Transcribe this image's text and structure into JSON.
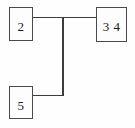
{
  "diagram": {
    "type": "node-link-graph",
    "width": 135,
    "height": 128,
    "background_color": "#fefefe",
    "line_color": "#3c3c3c",
    "border_color": "#4a4a4a",
    "text_color": "#1c1c1c",
    "nodes": [
      {
        "id": "node-2",
        "label": "2",
        "x": 9,
        "y": 7,
        "width": 24,
        "height": 34,
        "position": "top-left"
      },
      {
        "id": "node-34",
        "label": "3 4",
        "x": 96,
        "y": 7,
        "width": 31,
        "height": 35,
        "position": "top-right"
      },
      {
        "id": "node-5",
        "label": "5",
        "x": 9,
        "y": 86,
        "width": 24,
        "height": 33,
        "position": "bottom-left"
      }
    ],
    "edges": [
      {
        "id": "edge-2-to-34",
        "from": "node-2",
        "to": "node-34",
        "path": "M33,17 L127,17",
        "style": "orthogonal-horizontal"
      },
      {
        "id": "edge-junction-to-5",
        "from": "junction",
        "to": "node-5",
        "path": "M63,17 L63,96 L33,96",
        "style": "orthogonal-elbow"
      }
    ],
    "junctions": [
      {
        "id": "t-junction",
        "x": 63,
        "y": 17,
        "kind": "tee"
      },
      {
        "id": "l-corner",
        "x": 63,
        "y": 96,
        "kind": "elbow"
      }
    ]
  }
}
